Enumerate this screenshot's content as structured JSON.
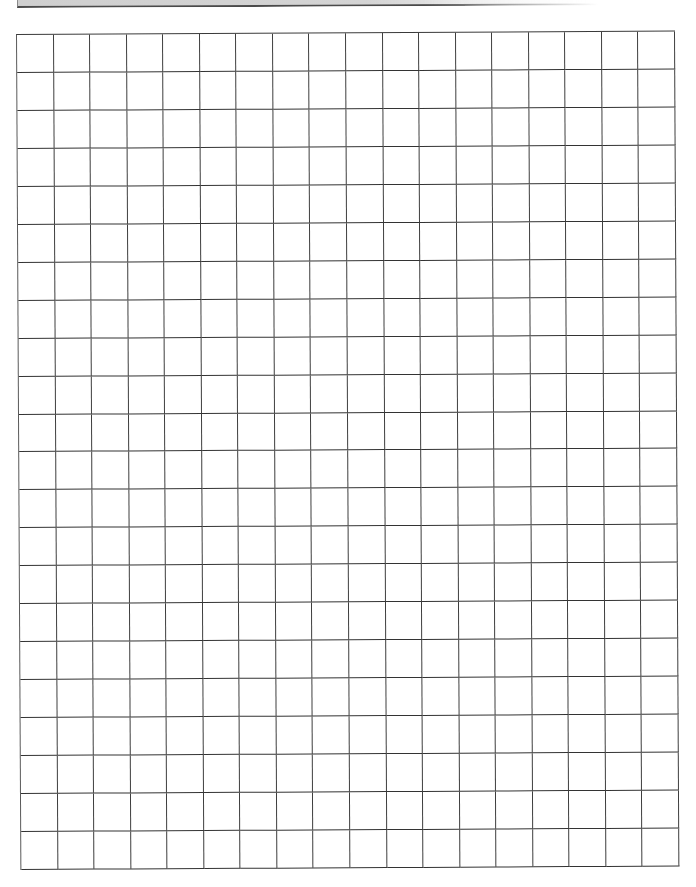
{
  "document": {
    "type": "graph-paper",
    "header_bar": {
      "color": "#d0d0d0",
      "border_color": "#4a4a4a"
    },
    "grid": {
      "columns": 18,
      "rows": 22,
      "line_color": "#3a3a3a",
      "background": "#ffffff"
    }
  }
}
